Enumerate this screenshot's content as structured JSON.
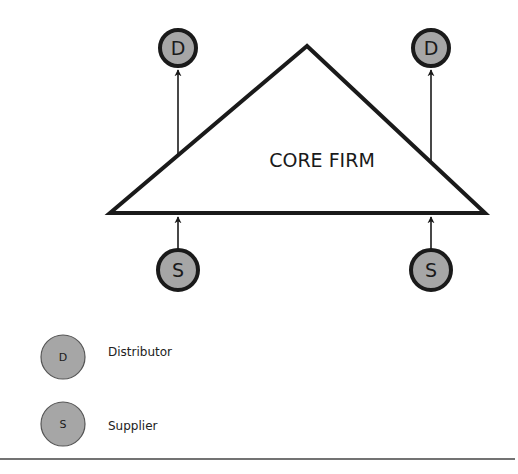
{
  "diagram": {
    "core": {
      "label": "CORE  FIRM"
    },
    "nodes": [
      {
        "type": "distributor",
        "letter": "D",
        "position": "top-left"
      },
      {
        "type": "distributor",
        "letter": "D",
        "position": "top-right"
      },
      {
        "type": "supplier",
        "letter": "S",
        "position": "bottom-left"
      },
      {
        "type": "supplier",
        "letter": "S",
        "position": "bottom-right"
      }
    ],
    "edges": [
      {
        "from": "core",
        "to": "distributor-top-left"
      },
      {
        "from": "core",
        "to": "distributor-top-right"
      },
      {
        "from": "supplier-bottom-left",
        "to": "core"
      },
      {
        "from": "supplier-bottom-right",
        "to": "core"
      }
    ]
  },
  "legend": [
    {
      "letter": "D",
      "label": "Distributor"
    },
    {
      "letter": "S",
      "label": "Supplier"
    }
  ],
  "colors": {
    "node_fill": "#a6a6a6",
    "stroke": "#1a1a1a",
    "background": "#ffffff"
  }
}
